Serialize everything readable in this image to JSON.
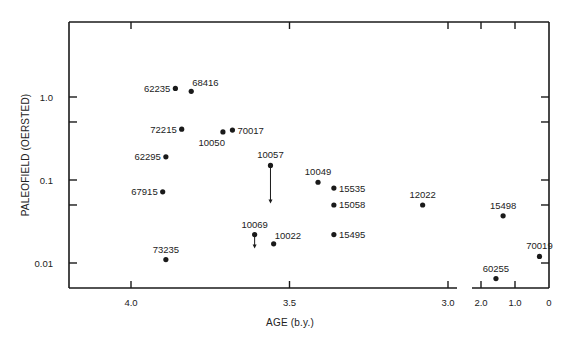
{
  "chart_data": {
    "type": "scatter",
    "title": "",
    "xlabel": "AGE (b.y.)",
    "ylabel": "PALEOFIELD (OERSTED)",
    "x_axis": {
      "reversed": true,
      "broken": true,
      "segments": [
        {
          "range": [
            4.3,
            2.97
          ],
          "ticks": [
            4.0,
            3.5,
            3.0
          ],
          "tick_labels": [
            "4.0",
            "3.5",
            "3.0"
          ]
        },
        {
          "range": [
            2.25,
            0
          ],
          "ticks": [
            2.0,
            1.0,
            0
          ],
          "tick_labels": [
            "2.0",
            "1.0",
            "0"
          ]
        }
      ]
    },
    "y_axis": {
      "scale": "log",
      "ylim": [
        0.005,
        6.5
      ],
      "ticks": [
        0.01,
        0.05,
        0.1,
        0.5,
        1.0
      ],
      "tick_labels": [
        "0.01",
        "",
        "0.1",
        "",
        "1.0"
      ]
    },
    "grid": false,
    "legend": null,
    "points": [
      {
        "label": "62235",
        "age": 3.86,
        "field": 1.27,
        "label_pos": "left"
      },
      {
        "label": "68416",
        "age": 3.81,
        "field": 1.17,
        "label_pos": "above-right"
      },
      {
        "label": "72215",
        "age": 3.84,
        "field": 0.41,
        "label_pos": "left"
      },
      {
        "label": "10050",
        "age": 3.71,
        "field": 0.38,
        "label_pos": "below-left"
      },
      {
        "label": "70017",
        "age": 3.68,
        "field": 0.4,
        "label_pos": "right"
      },
      {
        "label": "62295",
        "age": 3.89,
        "field": 0.19,
        "label_pos": "left"
      },
      {
        "label": "67915",
        "age": 3.9,
        "field": 0.072,
        "label_pos": "left"
      },
      {
        "label": "10057",
        "age": 3.56,
        "field": 0.15,
        "label_pos": "above",
        "upper_limit": true,
        "arrow_to": 0.052
      },
      {
        "label": "10049",
        "age": 3.41,
        "field": 0.094,
        "label_pos": "above"
      },
      {
        "label": "15535",
        "age": 3.36,
        "field": 0.08,
        "label_pos": "right"
      },
      {
        "label": "15058",
        "age": 3.36,
        "field": 0.05,
        "label_pos": "right"
      },
      {
        "label": "15495",
        "age": 3.36,
        "field": 0.022,
        "label_pos": "right"
      },
      {
        "label": "12022",
        "age": 3.08,
        "field": 0.05,
        "label_pos": "above"
      },
      {
        "label": "10069",
        "age": 3.61,
        "field": 0.022,
        "label_pos": "above",
        "upper_limit": true,
        "arrow_to": 0.015
      },
      {
        "label": "10022",
        "age": 3.55,
        "field": 0.017,
        "label_pos": "above-right"
      },
      {
        "label": "73235",
        "age": 3.89,
        "field": 0.011,
        "label_pos": "above"
      },
      {
        "label": "15498",
        "age": 1.35,
        "field": 0.037,
        "label_pos": "above"
      },
      {
        "label": "70019",
        "age": 0.28,
        "field": 0.012,
        "label_pos": "above"
      },
      {
        "label": "60255",
        "age": 1.56,
        "field": 0.0065,
        "label_pos": "above"
      }
    ]
  },
  "labels": {
    "xlabel": "AGE (b.y.)",
    "ylabel": "PALEOFIELD (OERSTED)"
  },
  "style": {
    "ink": "#1a1a1a",
    "background": "#ffffff"
  }
}
